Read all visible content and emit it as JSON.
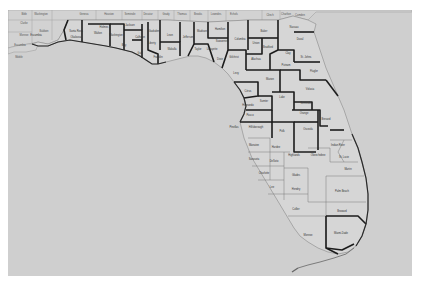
{
  "map": {
    "title": "Florida Counties",
    "colors": {
      "page": "#ffffff",
      "water": "#cfcfcf",
      "land": "#d6d6d6",
      "bold_border": "#1c1c1c",
      "thin_border": "#7a7a7a",
      "label": "#333333"
    },
    "neighbor_labels": [
      {
        "name": "Bibb",
        "x": 16,
        "y": 5
      },
      {
        "name": "Washington",
        "x": 33,
        "y": 5
      },
      {
        "name": "Clarke",
        "x": 16,
        "y": 14
      },
      {
        "name": "Monroe",
        "x": 16,
        "y": 26
      },
      {
        "name": "Baldwin",
        "x": 36,
        "y": 22
      },
      {
        "name": "Escambia",
        "x": 12,
        "y": 36
      },
      {
        "name": "Mobile",
        "x": 11,
        "y": 48
      },
      {
        "name": "Geneva",
        "x": 76,
        "y": 5
      },
      {
        "name": "Houston",
        "x": 101,
        "y": 5
      },
      {
        "name": "Seminole",
        "x": 122,
        "y": 5
      },
      {
        "name": "Decatur",
        "x": 140,
        "y": 5
      },
      {
        "name": "Grady",
        "x": 158,
        "y": 5
      },
      {
        "name": "Thomas",
        "x": 174,
        "y": 5
      },
      {
        "name": "Brooks",
        "x": 190,
        "y": 5
      },
      {
        "name": "Lowndes",
        "x": 208,
        "y": 5
      },
      {
        "name": "Echols",
        "x": 226,
        "y": 5
      },
      {
        "name": "Clinch",
        "x": 262,
        "y": 6
      },
      {
        "name": "Charlton",
        "x": 278,
        "y": 5
      },
      {
        "name": "Camden",
        "x": 292,
        "y": 6
      }
    ],
    "county_labels": [
      {
        "name": "Escambia",
        "x": 28,
        "y": 26
      },
      {
        "name": "Santa Rosa",
        "x": 68,
        "y": 22
      },
      {
        "name": "Okaloosa",
        "x": 68,
        "y": 28
      },
      {
        "name": "Walton",
        "x": 90,
        "y": 24
      },
      {
        "name": "Holmes",
        "x": 96,
        "y": 18
      },
      {
        "name": "Washington",
        "x": 108,
        "y": 26
      },
      {
        "name": "Jackson",
        "x": 122,
        "y": 16
      },
      {
        "name": "Bay",
        "x": 116,
        "y": 36
      },
      {
        "name": "Calhoun",
        "x": 132,
        "y": 28
      },
      {
        "name": "Gulf",
        "x": 132,
        "y": 44
      },
      {
        "name": "Gadsden",
        "x": 146,
        "y": 22
      },
      {
        "name": "Liberty",
        "x": 144,
        "y": 34
      },
      {
        "name": "Franklin",
        "x": 150,
        "y": 48
      },
      {
        "name": "Leon",
        "x": 162,
        "y": 26
      },
      {
        "name": "Wakulla",
        "x": 164,
        "y": 40
      },
      {
        "name": "Jefferson",
        "x": 180,
        "y": 28
      },
      {
        "name": "Madison",
        "x": 194,
        "y": 22
      },
      {
        "name": "Taylor",
        "x": 190,
        "y": 40
      },
      {
        "name": "Hamilton",
        "x": 212,
        "y": 20
      },
      {
        "name": "Suwannee",
        "x": 214,
        "y": 32
      },
      {
        "name": "Lafayette",
        "x": 204,
        "y": 40
      },
      {
        "name": "Dixie",
        "x": 212,
        "y": 50
      },
      {
        "name": "Columbia",
        "x": 232,
        "y": 30
      },
      {
        "name": "Gilchrist",
        "x": 226,
        "y": 48
      },
      {
        "name": "Levy",
        "x": 228,
        "y": 64
      },
      {
        "name": "Baker",
        "x": 256,
        "y": 22
      },
      {
        "name": "Union",
        "x": 248,
        "y": 34
      },
      {
        "name": "Bradford",
        "x": 260,
        "y": 38
      },
      {
        "name": "Alachua",
        "x": 248,
        "y": 50
      },
      {
        "name": "Nassau",
        "x": 286,
        "y": 18
      },
      {
        "name": "Duval",
        "x": 292,
        "y": 30
      },
      {
        "name": "Clay",
        "x": 280,
        "y": 44
      },
      {
        "name": "St. Johns",
        "x": 298,
        "y": 48
      },
      {
        "name": "Putnam",
        "x": 278,
        "y": 56
      },
      {
        "name": "Flagler",
        "x": 306,
        "y": 62
      },
      {
        "name": "Marion",
        "x": 262,
        "y": 70
      },
      {
        "name": "Citrus",
        "x": 240,
        "y": 82
      },
      {
        "name": "Sumter",
        "x": 256,
        "y": 92
      },
      {
        "name": "Lake",
        "x": 274,
        "y": 88
      },
      {
        "name": "Volusia",
        "x": 302,
        "y": 80
      },
      {
        "name": "Hernando",
        "x": 240,
        "y": 96
      },
      {
        "name": "Pasco",
        "x": 242,
        "y": 106
      },
      {
        "name": "Seminole",
        "x": 298,
        "y": 94
      },
      {
        "name": "Orange",
        "x": 296,
        "y": 104
      },
      {
        "name": "Pinellas",
        "x": 226,
        "y": 118
      },
      {
        "name": "Hillsborough",
        "x": 248,
        "y": 118
      },
      {
        "name": "Polk",
        "x": 274,
        "y": 122
      },
      {
        "name": "Osceola",
        "x": 300,
        "y": 120
      },
      {
        "name": "Brevard",
        "x": 318,
        "y": 110
      },
      {
        "name": "Manatee",
        "x": 246,
        "y": 136
      },
      {
        "name": "Hardee",
        "x": 268,
        "y": 138
      },
      {
        "name": "Highlands",
        "x": 286,
        "y": 146
      },
      {
        "name": "Indian River",
        "x": 330,
        "y": 136
      },
      {
        "name": "Okeechobee",
        "x": 310,
        "y": 146
      },
      {
        "name": "St. Lucie",
        "x": 336,
        "y": 148
      },
      {
        "name": "Sarasota",
        "x": 246,
        "y": 150
      },
      {
        "name": "DeSoto",
        "x": 266,
        "y": 152
      },
      {
        "name": "Martin",
        "x": 340,
        "y": 160
      },
      {
        "name": "Charlotte",
        "x": 256,
        "y": 164
      },
      {
        "name": "Glades",
        "x": 288,
        "y": 166
      },
      {
        "name": "Lee",
        "x": 264,
        "y": 178
      },
      {
        "name": "Hendry",
        "x": 288,
        "y": 180
      },
      {
        "name": "Palm Beach",
        "x": 334,
        "y": 182
      },
      {
        "name": "Collier",
        "x": 288,
        "y": 200
      },
      {
        "name": "Broward",
        "x": 334,
        "y": 202
      },
      {
        "name": "Monroe",
        "x": 300,
        "y": 226
      },
      {
        "name": "Miami-Dade",
        "x": 333,
        "y": 224
      }
    ]
  }
}
